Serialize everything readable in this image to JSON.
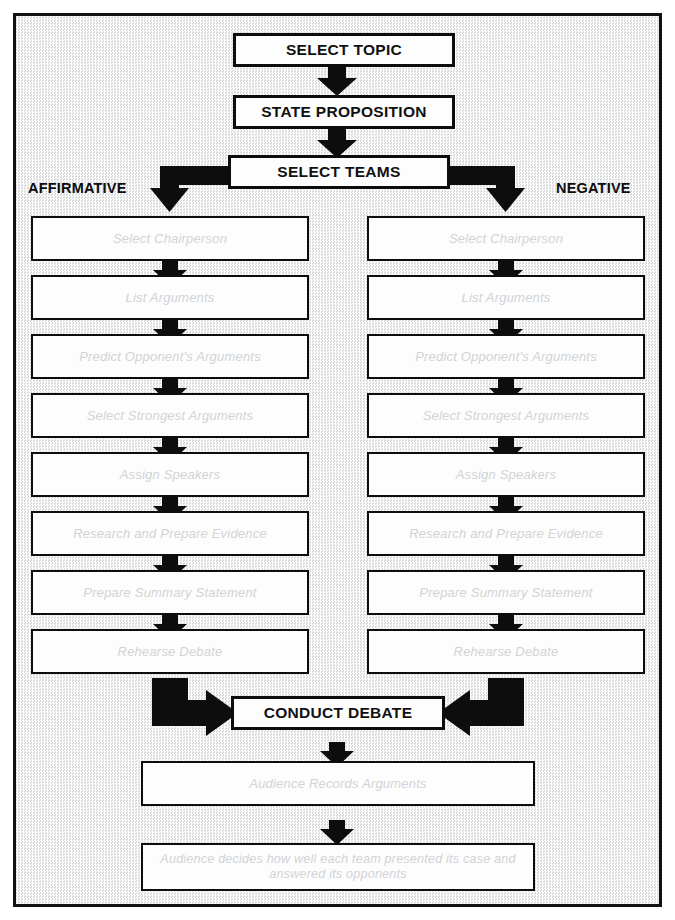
{
  "diagram": {
    "colors": {
      "ink": "#0d0d0d",
      "box_fill": "#fdfdfd",
      "background": "#eceded",
      "step_text": "#d2d3d5"
    },
    "top_nodes": [
      {
        "id": "select-topic",
        "label": "SELECT TOPIC"
      },
      {
        "id": "state-proposition",
        "label": "STATE PROPOSITION"
      },
      {
        "id": "select-teams",
        "label": "SELECT TEAMS"
      }
    ],
    "branch_labels": {
      "left": "AFFIRMATIVE",
      "right": "NEGATIVE"
    },
    "affirmative_steps": [
      "Select Chairperson",
      "List Arguments",
      "Predict Opponent's Arguments",
      "Select Strongest Arguments",
      "Assign Speakers",
      "Research and Prepare Evidence",
      "Prepare Summary Statement",
      "Rehearse Debate"
    ],
    "negative_steps": [
      "Select Chairperson",
      "List Arguments",
      "Predict Opponent's Arguments",
      "Select Strongest Arguments",
      "Assign Speakers",
      "Research and Prepare Evidence",
      "Prepare Summary Statement",
      "Rehearse Debate"
    ],
    "merge_node": {
      "id": "conduct-debate",
      "label": "CONDUCT DEBATE"
    },
    "bottom_nodes": [
      {
        "id": "audience-records",
        "label": "Audience Records Arguments"
      },
      {
        "id": "audience-decides",
        "line1": "Audience decides how well each team presented its case and",
        "line2": "answered its opponents"
      }
    ]
  }
}
